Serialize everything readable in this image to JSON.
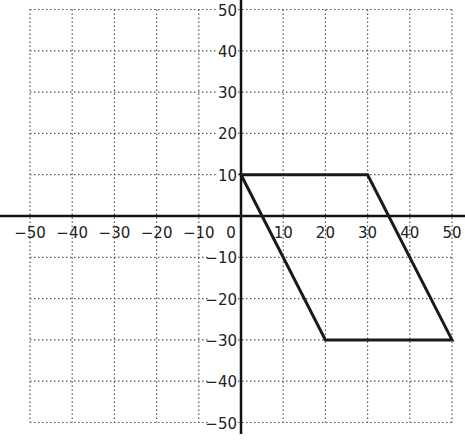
{
  "chart_data": {
    "type": "line",
    "title": "",
    "xlabel": "",
    "ylabel": "",
    "xlim": [
      -50,
      50
    ],
    "ylim": [
      -50,
      50
    ],
    "grid": true,
    "grid_style": "dotted",
    "x_ticks": [
      -50,
      -40,
      -30,
      -20,
      -10,
      0,
      10,
      20,
      30,
      40,
      50
    ],
    "y_ticks": [
      50,
      40,
      30,
      20,
      10,
      -10,
      -20,
      -30,
      -40,
      -50
    ],
    "x_tick_labels": [
      "−50",
      "−40",
      "−30",
      "−20",
      "−10",
      "0",
      "10",
      "20",
      "30",
      "40",
      "50"
    ],
    "y_tick_labels": [
      "50",
      "40",
      "30",
      "20",
      "10",
      "−10",
      "−20",
      "−30",
      "−40",
      "−50"
    ],
    "series": [
      {
        "name": "parallelogram",
        "closed": true,
        "points": [
          [
            0,
            10
          ],
          [
            30,
            10
          ],
          [
            50,
            -30
          ],
          [
            20,
            -30
          ]
        ]
      }
    ],
    "legend": null
  },
  "colors": {
    "axis": "#111111",
    "grid": "#555555",
    "shape": "#1a1a1a",
    "background": "#ffffff"
  }
}
